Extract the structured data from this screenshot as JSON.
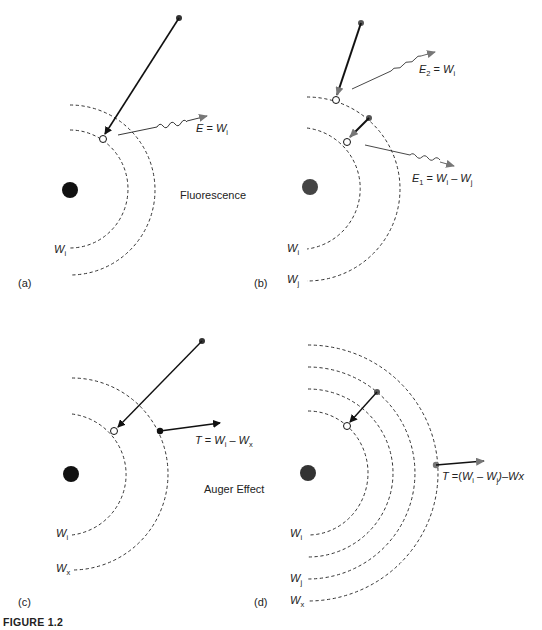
{
  "figure": {
    "caption": "FIGURE 1.2",
    "panels": [
      {
        "id": "a",
        "label": "(a)",
        "process_label": "Fluorescence",
        "shells": [
          "W",
          "i"
        ],
        "photon_label": {
          "lhs": "E",
          "eq": " = ",
          "var": "W",
          "sub": "i"
        }
      },
      {
        "id": "b",
        "label": "(b)",
        "shells": [
          {
            "var": "W",
            "sub": "i"
          },
          {
            "var": "W",
            "sub": "j"
          }
        ],
        "photon_label_1": {
          "lhs": "E",
          "lhs_sub": "1",
          "eq": " = ",
          "var1": "W",
          "sub1": "i",
          "minus": " – ",
          "var2": "W",
          "sub2": "j"
        },
        "photon_label_2": {
          "lhs": "E",
          "lhs_sub": "2",
          "eq": " = ",
          "var": "W",
          "sub": "i"
        }
      },
      {
        "id": "c",
        "label": "(c)",
        "process_label": "Auger Effect",
        "shells": [
          {
            "var": "W",
            "sub": "i"
          },
          {
            "var": "W",
            "sub": "x"
          }
        ],
        "electron_label": {
          "lhs": "T",
          "eq": " = ",
          "var1": "W",
          "sub1": "i",
          "minus": " – ",
          "var2": "W",
          "sub2": "x"
        }
      },
      {
        "id": "d",
        "label": "(d)",
        "shells": [
          {
            "var": "W",
            "sub": "i"
          },
          {
            "var": "W",
            "sub": "j"
          },
          {
            "var": "W",
            "sub": "x"
          }
        ],
        "electron_label": {
          "lhs": "T",
          "eq": " =(",
          "var1": "W",
          "sub1": "i",
          "minus": " – ",
          "var2": "W",
          "sub2": "j",
          "tail": ")–Wx"
        }
      }
    ]
  }
}
